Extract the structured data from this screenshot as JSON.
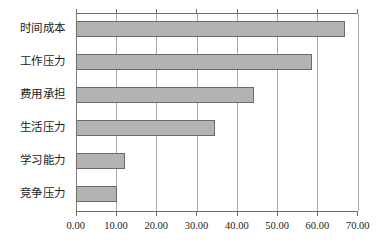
{
  "chart_data": {
    "type": "bar",
    "orientation": "horizontal",
    "title": "",
    "subtitle": "",
    "xlabel": "",
    "ylabel": "",
    "categories": [
      "时间成本",
      "工作压力",
      "费用承担",
      "生活压力",
      "学习能力",
      "竞争压力"
    ],
    "values": [
      66.9,
      58.6,
      44.3,
      34.6,
      12.3,
      10.3
    ],
    "series": [
      {
        "name": "",
        "values": [
          66.9,
          58.6,
          44.3,
          34.6,
          12.3,
          10.3
        ]
      }
    ],
    "xlim": [
      0,
      70
    ],
    "xticks": [
      0,
      10,
      20,
      30,
      40,
      50,
      60,
      70
    ],
    "xtick_labels": [
      "0.00",
      "10.00",
      "20.00",
      "30.00",
      "40.00",
      "50.00",
      "60.00",
      "70.00"
    ],
    "grid": "vertical",
    "legend": "none",
    "bar_color": "#b3b3b3",
    "bar_border_color": "#6b6b6b",
    "gridline_color": "#a8a8a8",
    "axis_color": "#6f6f6f",
    "background_color": "#ffffff",
    "annotations": []
  }
}
